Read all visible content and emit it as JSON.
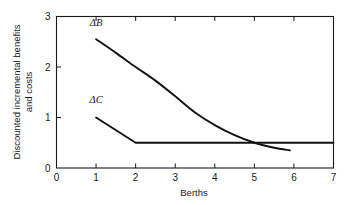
{
  "chart_data": {
    "type": "line",
    "title": "",
    "subtitle": "",
    "xlabel": "Berths",
    "ylabel_line1": "Discounted incremental benefits",
    "ylabel_line2": "and costs",
    "xlim": [
      0,
      7
    ],
    "ylim": [
      0,
      3
    ],
    "xticks": [
      0,
      1,
      2,
      3,
      4,
      5,
      6,
      7
    ],
    "xticklabels": [
      "0",
      "1",
      "2",
      "3",
      "4",
      "5",
      "6",
      "7"
    ],
    "yticks": [
      0,
      1,
      2,
      3
    ],
    "yticklabels": [
      "0",
      "1",
      "2",
      "3"
    ],
    "grid": false,
    "legend_position": "inline-annotation",
    "frame": "box",
    "tick_direction": "in",
    "series": [
      {
        "name": "ΔB",
        "label": "ΔB",
        "label_x": 1.0,
        "label_y": 2.82,
        "color": "#111111",
        "x": [
          1.0,
          1.5,
          2.0,
          2.5,
          3.0,
          3.5,
          4.0,
          4.5,
          5.0,
          5.5,
          5.9
        ],
        "y": [
          2.55,
          2.28,
          2.0,
          1.73,
          1.42,
          1.1,
          0.85,
          0.65,
          0.5,
          0.4,
          0.35
        ]
      },
      {
        "name": "ΔC",
        "label": "ΔC",
        "label_x": 1.0,
        "label_y": 1.28,
        "color": "#111111",
        "x": [
          1.0,
          2.0,
          7.0
        ],
        "y": [
          1.0,
          0.5,
          0.5
        ]
      }
    ],
    "annotations": [
      {
        "text": "ΔB",
        "x": 1.0,
        "y": 2.82
      },
      {
        "text": "ΔC",
        "x": 1.0,
        "y": 1.28
      }
    ],
    "crossing_point": {
      "x": 5.0,
      "y": 0.5
    }
  }
}
